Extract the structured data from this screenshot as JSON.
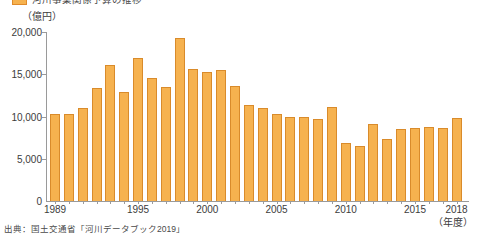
{
  "legend": {
    "label": "河川事業関係予算の推移",
    "swatch_color": "#f6b24f"
  },
  "unit_label": "（億円）",
  "xaxis_unit": "（年度）",
  "source_note": "出典：国土交通省「河川データブック2019」",
  "colors": {
    "bar_fill": "#f6b24f",
    "bar_stroke": "#d98b2b",
    "axis": "#9a9a9a",
    "text": "#3c3c3c",
    "background": "#ffffff"
  },
  "chart_data": {
    "type": "bar",
    "title": "河川事業関係予算の推移",
    "xlabel": "（年度）",
    "ylabel": "（億円）",
    "ylim": [
      0,
      20000
    ],
    "yticks": [
      0,
      5000,
      10000,
      15000,
      20000
    ],
    "ytick_labels": [
      "0",
      "5,000",
      "10,000",
      "15,000",
      "20,000"
    ],
    "xtick_years": [
      1989,
      1995,
      2000,
      2005,
      2010,
      2015,
      2018
    ],
    "xtick_labels": [
      "1989",
      "1995",
      "2000",
      "2005",
      "2010",
      "2015",
      "2018"
    ],
    "grid": false,
    "legend_position": "top-left",
    "categories": [
      "1989",
      "1990",
      "1991",
      "1992",
      "1993",
      "1994",
      "1995",
      "1996",
      "1997",
      "1998",
      "1999",
      "2000",
      "2001",
      "2002",
      "2003",
      "2004",
      "2005",
      "2006",
      "2007",
      "2008",
      "2009",
      "2010",
      "2011",
      "2012",
      "2013",
      "2014",
      "2015",
      "2016",
      "2017",
      "2018"
    ],
    "values": [
      10300,
      10300,
      11000,
      13400,
      16100,
      12900,
      16900,
      14600,
      13500,
      19300,
      15600,
      15300,
      15500,
      13600,
      11400,
      11000,
      10300,
      10000,
      9900,
      9700,
      11100,
      6900,
      6500,
      9100,
      7300,
      8500,
      8700,
      8800,
      8600,
      9800
    ]
  }
}
